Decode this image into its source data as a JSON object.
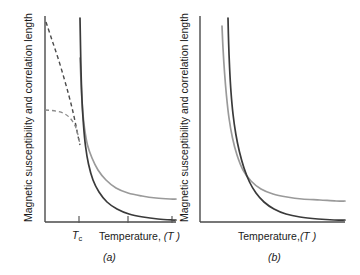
{
  "figure": {
    "background": "#ffffff",
    "width": 360,
    "height": 275,
    "colors": {
      "dark_curve": "#3a3a3a",
      "gray_curve": "#9a9a9a",
      "axis": "#4a4a4a",
      "text": "#1a1a1a"
    }
  },
  "chart_data": {
    "type": "line",
    "title": "",
    "panels": [
      {
        "id": "a",
        "caption": "(a)",
        "xlabel": "Temperature, (T)",
        "ylabel": "Magnetic susceptibility and correlation length",
        "grid": false,
        "legend": "none",
        "xticks": [
          "T_c"
        ],
        "annotations": [
          "T_c"
        ],
        "description": "Sharp divergence at the critical temperature T_c; susceptibility and correlation length diverge as T approaches T_c from above and below.",
        "axis": {
          "x0": 45,
          "x1": 176,
          "y0": 16,
          "y1": 222
        },
        "tick_positions": [
          79,
          128,
          172
        ],
        "series": [
          {
            "name": "correlation-length-above-Tc",
            "style": "solid-gray",
            "points": [
              [
                80,
                58
              ],
              [
                80.6,
                72
              ],
              [
                81.4,
                90
              ],
              [
                82.6,
                110
              ],
              [
                84.5,
                128
              ],
              [
                87.5,
                145
              ],
              [
                92,
                158
              ],
              [
                98,
                170
              ],
              [
                106,
                180
              ],
              [
                116,
                188
              ],
              [
                128,
                193
              ],
              [
                142,
                196
              ],
              [
                156,
                198
              ],
              [
                170,
                199
              ],
              [
                176,
                199
              ]
            ]
          },
          {
            "name": "susceptibility-above-Tc",
            "style": "solid-dark",
            "points": [
              [
                80,
                18
              ],
              [
                80.4,
                40
              ],
              [
                81,
                70
              ],
              [
                82,
                100
              ],
              [
                83.5,
                125
              ],
              [
                85.5,
                146
              ],
              [
                88.5,
                164
              ],
              [
                93,
                180
              ],
              [
                99,
                192
              ],
              [
                107,
                202
              ],
              [
                117,
                209
              ],
              [
                129,
                214
              ],
              [
                143,
                217
              ],
              [
                158,
                219
              ],
              [
                172,
                220
              ],
              [
                176,
                220
              ]
            ]
          },
          {
            "name": "susceptibility-below-Tc-dashed",
            "style": "dashed-dark",
            "points": [
              [
                46,
                22
              ],
              [
                52,
                40
              ],
              [
                58,
                58
              ],
              [
                64,
                78
              ],
              [
                69,
                96
              ],
              [
                73,
                112
              ],
              [
                76,
                126
              ],
              [
                78,
                136
              ],
              [
                79.3,
                142
              ],
              [
                80,
                145
              ]
            ]
          },
          {
            "name": "correlation-length-below-Tc-dashed",
            "style": "dashed-gray",
            "points": [
              [
                45,
                110
              ],
              [
                52,
                110.5
              ],
              [
                58,
                111.5
              ],
              [
                64,
                113.5
              ],
              [
                69,
                117
              ],
              [
                73,
                122
              ],
              [
                76,
                128
              ],
              [
                78,
                135
              ],
              [
                79.3,
                141
              ],
              [
                80,
                145
              ]
            ]
          }
        ]
      },
      {
        "id": "b",
        "caption": "(b)",
        "xlabel": "Temperature,(T)",
        "ylabel": "Magnetic susceptibility and correlation length",
        "grid": false,
        "legend": "none",
        "xticks": [],
        "annotations": [],
        "description": "Rounded, non-divergent behaviour: both quantities rise steeply but remain finite, with no sharp critical point.",
        "axis": {
          "x0": 200,
          "x1": 345,
          "y0": 16,
          "y1": 222
        },
        "tick_positions": [],
        "series": [
          {
            "name": "correlation-length-rounded",
            "style": "solid-gray",
            "points": [
              [
                222,
                26
              ],
              [
                223,
                48
              ],
              [
                224.5,
                72
              ],
              [
                226.5,
                96
              ],
              [
                229,
                118
              ],
              [
                232.5,
                138
              ],
              [
                237,
                155
              ],
              [
                243,
                170
              ],
              [
                251,
                181
              ],
              [
                261,
                189
              ],
              [
                273,
                194
              ],
              [
                287,
                197
              ],
              [
                302,
                199
              ],
              [
                320,
                200
              ],
              [
                336,
                201
              ],
              [
                345,
                201
              ]
            ]
          },
          {
            "name": "susceptibility-rounded",
            "style": "solid-dark",
            "points": [
              [
                228,
                18
              ],
              [
                228.6,
                42
              ],
              [
                229.6,
                68
              ],
              [
                231,
                92
              ],
              [
                233,
                114
              ],
              [
                235.8,
                134
              ],
              [
                239.5,
                152
              ],
              [
                244,
                168
              ],
              [
                249.5,
                182
              ],
              [
                256,
                193
              ],
              [
                264,
                202
              ],
              [
                274,
                209
              ],
              [
                286,
                214
              ],
              [
                300,
                217
              ],
              [
                318,
                219
              ],
              [
                334,
                220
              ],
              [
                345,
                220
              ]
            ]
          }
        ]
      }
    ]
  },
  "panel_a": {
    "xlabel_main": "Temperature,",
    "xlabel_var": "(T )",
    "tc_label": "T",
    "tc_sub": "c",
    "caption": "(a)",
    "ylabel": "Magnetic susceptibility and correlation length"
  },
  "panel_b": {
    "xlabel_main": "Temperature,",
    "xlabel_var": "(T )",
    "caption": "(b)",
    "ylabel": "Magnetic susceptibility and correlation length"
  }
}
